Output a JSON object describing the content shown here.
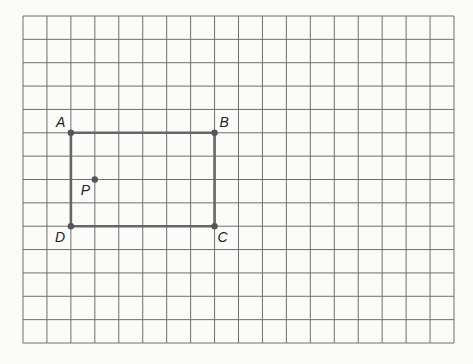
{
  "diagram": {
    "type": "grid-figure",
    "grid": {
      "columns": 18,
      "rows": 14,
      "left": 23,
      "top": 16,
      "right": 454,
      "bottom": 343,
      "line_color": "#6f6f6f"
    },
    "rectangle": {
      "vertices": [
        "A",
        "B",
        "C",
        "D"
      ],
      "stroke_color": "#666666"
    },
    "points": [
      {
        "label": "A",
        "col": 2,
        "row": 5
      },
      {
        "label": "B",
        "col": 8,
        "row": 5
      },
      {
        "label": "C",
        "col": 8,
        "row": 9
      },
      {
        "label": "D",
        "col": 2,
        "row": 9
      },
      {
        "label": "P",
        "col": 3,
        "row": 7
      }
    ]
  }
}
